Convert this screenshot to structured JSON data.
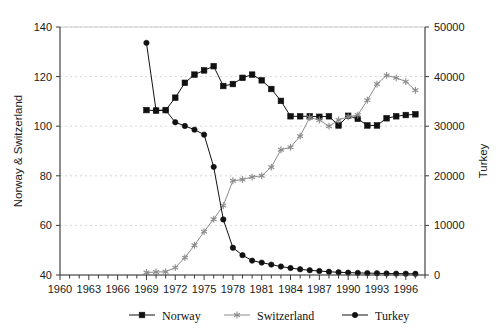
{
  "chart_data": {
    "type": "line",
    "title": "",
    "xlabel": "",
    "ylabel": "Norway & Switzerland",
    "ylabel_secondary": "Turkey",
    "xlim": [
      1960,
      1998
    ],
    "ylim": [
      40,
      140
    ],
    "ylim_secondary": [
      0,
      50000
    ],
    "grid": true,
    "legend_position": "bottom",
    "x_tick_labels": [
      "1960",
      "1963",
      "1966",
      "1969",
      "1972",
      "1975",
      "1978",
      "1981",
      "1984",
      "1987",
      "1990",
      "1993",
      "1996"
    ],
    "x_tick_values": [
      1960,
      1963,
      1966,
      1969,
      1972,
      1975,
      1978,
      1981,
      1984,
      1987,
      1990,
      1993,
      1996
    ],
    "x_minor_tick_step": 1,
    "y_tick_labels": [
      "40",
      "60",
      "80",
      "100",
      "120",
      "140"
    ],
    "y_tick_values": [
      40,
      60,
      80,
      100,
      120,
      140
    ],
    "y2_tick_labels": [
      "0",
      "10000",
      "20000",
      "30000",
      "40000",
      "50000"
    ],
    "y2_tick_values": [
      0,
      10000,
      20000,
      30000,
      40000,
      50000
    ],
    "series": [
      {
        "name": "Norway",
        "axis": "left",
        "marker": "square",
        "color": "#111111",
        "x": [
          1969,
          1970,
          1971,
          1972,
          1973,
          1974,
          1975,
          1976,
          1977,
          1978,
          1979,
          1980,
          1981,
          1982,
          1983,
          1984,
          1985,
          1986,
          1987,
          1988,
          1989,
          1990,
          1991,
          1992,
          1993,
          1994,
          1995,
          1996,
          1997
        ],
        "values": [
          106.5,
          106.3,
          106.5,
          111.5,
          117.5,
          120.8,
          122.5,
          124.2,
          116.2,
          117.0,
          119.5,
          120.8,
          118.5,
          115.0,
          110.2,
          104.0,
          104.0,
          104.0,
          103.8,
          104.0,
          100.3,
          104.2,
          103.0,
          100.3,
          100.3,
          103.2,
          104.0,
          104.5,
          104.8
        ]
      },
      {
        "name": "Switzerland",
        "axis": "left",
        "marker": "star",
        "color": "#8a8a8a",
        "x": [
          1969,
          1970,
          1971,
          1972,
          1973,
          1974,
          1975,
          1976,
          1977,
          1978,
          1979,
          1980,
          1981,
          1982,
          1983,
          1984,
          1985,
          1986,
          1987,
          1988,
          1989,
          1990,
          1991,
          1992,
          1993,
          1994,
          1995,
          1996,
          1997
        ],
        "values": [
          41.0,
          41.2,
          41.3,
          43.0,
          47.0,
          52.0,
          57.5,
          62.5,
          68.0,
          78.0,
          78.5,
          79.5,
          80.0,
          83.5,
          90.5,
          91.5,
          96.0,
          103.5,
          102.5,
          100.0,
          102.5,
          103.8,
          104.5,
          110.5,
          117.0,
          120.5,
          119.5,
          118.0,
          114.5
        ]
      },
      {
        "name": "Turkey",
        "axis": "right",
        "marker": "circle",
        "color": "#111111",
        "x": [
          1969,
          1970,
          1971,
          1972,
          1973,
          1974,
          1975,
          1976,
          1977,
          1978,
          1979,
          1980,
          1981,
          1982,
          1983,
          1984,
          1985,
          1986,
          1987,
          1988,
          1989,
          1990,
          1991,
          1992,
          1993,
          1994,
          1995,
          1996,
          1997
        ],
        "values": [
          46800,
          33200,
          33200,
          30800,
          30050,
          29300,
          28300,
          21800,
          11200,
          5500,
          4000,
          2900,
          2500,
          2100,
          1700,
          1400,
          1150,
          950,
          800,
          650,
          550,
          480,
          420,
          380,
          340,
          300,
          280,
          260,
          240
        ]
      }
    ],
    "legend": [
      {
        "label": "Norway",
        "marker": "square",
        "color": "#111111"
      },
      {
        "label": "Switzerland",
        "marker": "star",
        "color": "#8a8a8a"
      },
      {
        "label": "Turkey",
        "marker": "circle",
        "color": "#111111"
      }
    ]
  }
}
